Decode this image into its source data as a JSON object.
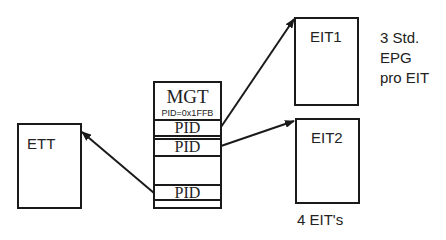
{
  "diagram": {
    "tables": {
      "ett": {
        "label": "ETT"
      },
      "mgt": {
        "label": "MGT",
        "pid_value": "PID=0x1FFB",
        "rows": [
          "PID",
          "PID",
          "PID"
        ]
      },
      "eit1": {
        "label": "EIT1"
      },
      "eit2": {
        "label": "EIT2"
      }
    },
    "annotations": {
      "epg_line1": "3 Std.",
      "epg_line2": "EPG",
      "epg_line3": "pro EIT",
      "eit_count": "4 EIT's"
    },
    "arrows": [
      {
        "from": "mgt.row1",
        "to": "eit1"
      },
      {
        "from": "mgt.row2",
        "to": "eit2"
      },
      {
        "from": "mgt.row3",
        "to": "ett"
      }
    ],
    "colors": {
      "line": "#1a1a1a",
      "text": "#222222",
      "background": "#ffffff"
    }
  }
}
